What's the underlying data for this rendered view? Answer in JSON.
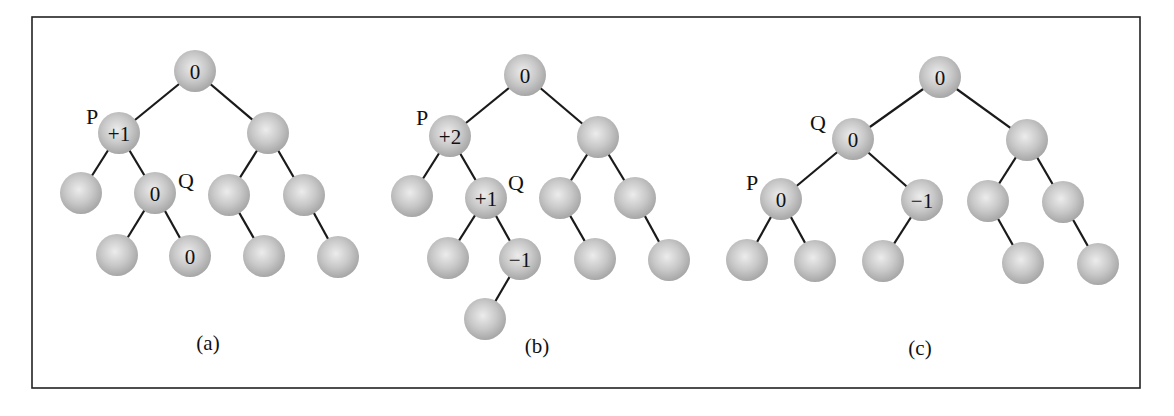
{
  "figure": {
    "frame": {
      "x": 32,
      "y": 17,
      "width": 1108,
      "height": 371
    },
    "node_radius": 21,
    "colors": {
      "node_center": "#ececec",
      "node_mid": "#c8c8c8",
      "node_edge": "#a4a4a4",
      "edge": "#1a1a1a",
      "text": "#111111"
    },
    "trees": [
      {
        "id": "a",
        "caption": "(a)",
        "caption_pos": [
          208,
          343
        ],
        "nodes": [
          {
            "id": "a0",
            "x": 195,
            "y": 71,
            "label": "0"
          },
          {
            "id": "a1",
            "x": 119,
            "y": 133,
            "label": "+1"
          },
          {
            "id": "a2",
            "x": 268,
            "y": 133,
            "label": ""
          },
          {
            "id": "a3",
            "x": 81,
            "y": 193,
            "label": ""
          },
          {
            "id": "a4",
            "x": 155,
            "y": 193,
            "label": "0"
          },
          {
            "id": "a5",
            "x": 229,
            "y": 195,
            "label": ""
          },
          {
            "id": "a6",
            "x": 304,
            "y": 195,
            "label": ""
          },
          {
            "id": "a7",
            "x": 117,
            "y": 255,
            "label": ""
          },
          {
            "id": "a8",
            "x": 190,
            "y": 256,
            "label": "0"
          },
          {
            "id": "a9",
            "x": 264,
            "y": 256,
            "label": ""
          },
          {
            "id": "a10",
            "x": 338,
            "y": 257,
            "label": ""
          }
        ],
        "edges": [
          [
            "a0",
            "a1"
          ],
          [
            "a0",
            "a2"
          ],
          [
            "a1",
            "a3"
          ],
          [
            "a1",
            "a4"
          ],
          [
            "a2",
            "a5"
          ],
          [
            "a2",
            "a6"
          ],
          [
            "a4",
            "a7"
          ],
          [
            "a4",
            "a8"
          ],
          [
            "a5",
            "a9"
          ],
          [
            "a6",
            "a10"
          ]
        ],
        "pointers": [
          {
            "label": "P",
            "x": 92,
            "y": 116
          },
          {
            "label": "Q",
            "x": 186,
            "y": 180
          }
        ]
      },
      {
        "id": "b",
        "caption": "(b)",
        "caption_pos": [
          537,
          346
        ],
        "nodes": [
          {
            "id": "b0",
            "x": 525,
            "y": 75,
            "label": "0"
          },
          {
            "id": "b1",
            "x": 450,
            "y": 136,
            "label": "+2"
          },
          {
            "id": "b2",
            "x": 598,
            "y": 137,
            "label": ""
          },
          {
            "id": "b3",
            "x": 412,
            "y": 196,
            "label": ""
          },
          {
            "id": "b4",
            "x": 486,
            "y": 198,
            "label": "+1"
          },
          {
            "id": "b5",
            "x": 560,
            "y": 198,
            "label": ""
          },
          {
            "id": "b6",
            "x": 635,
            "y": 198,
            "label": ""
          },
          {
            "id": "b7",
            "x": 448,
            "y": 258,
            "label": ""
          },
          {
            "id": "b8",
            "x": 520,
            "y": 259,
            "label": "−1"
          },
          {
            "id": "b9",
            "x": 595,
            "y": 259,
            "label": ""
          },
          {
            "id": "b10",
            "x": 669,
            "y": 260,
            "label": ""
          },
          {
            "id": "b11",
            "x": 485,
            "y": 319,
            "label": ""
          }
        ],
        "edges": [
          [
            "b0",
            "b1"
          ],
          [
            "b0",
            "b2"
          ],
          [
            "b1",
            "b3"
          ],
          [
            "b1",
            "b4"
          ],
          [
            "b2",
            "b5"
          ],
          [
            "b2",
            "b6"
          ],
          [
            "b4",
            "b7"
          ],
          [
            "b4",
            "b8"
          ],
          [
            "b5",
            "b9"
          ],
          [
            "b6",
            "b10"
          ],
          [
            "b8",
            "b11"
          ]
        ],
        "pointers": [
          {
            "label": "P",
            "x": 422,
            "y": 117
          },
          {
            "label": "Q",
            "x": 516,
            "y": 182
          }
        ]
      },
      {
        "id": "c",
        "caption": "(c)",
        "caption_pos": [
          920,
          348
        ],
        "nodes": [
          {
            "id": "c0",
            "x": 940,
            "y": 77,
            "label": "0"
          },
          {
            "id": "c1",
            "x": 853,
            "y": 139,
            "label": "0"
          },
          {
            "id": "c2",
            "x": 1027,
            "y": 140,
            "label": ""
          },
          {
            "id": "c3",
            "x": 781,
            "y": 199,
            "label": "0"
          },
          {
            "id": "c4",
            "x": 922,
            "y": 200,
            "label": "−1"
          },
          {
            "id": "c5",
            "x": 988,
            "y": 201,
            "label": ""
          },
          {
            "id": "c6",
            "x": 1063,
            "y": 202,
            "label": ""
          },
          {
            "id": "c7",
            "x": 747,
            "y": 260,
            "label": ""
          },
          {
            "id": "c8",
            "x": 815,
            "y": 261,
            "label": ""
          },
          {
            "id": "c9",
            "x": 883,
            "y": 261,
            "label": ""
          },
          {
            "id": "c10",
            "x": 1023,
            "y": 263,
            "label": ""
          },
          {
            "id": "c11",
            "x": 1098,
            "y": 264,
            "label": ""
          }
        ],
        "edges": [
          [
            "c0",
            "c1"
          ],
          [
            "c0",
            "c2"
          ],
          [
            "c1",
            "c3"
          ],
          [
            "c1",
            "c4"
          ],
          [
            "c2",
            "c5"
          ],
          [
            "c2",
            "c6"
          ],
          [
            "c3",
            "c7"
          ],
          [
            "c3",
            "c8"
          ],
          [
            "c4",
            "c9"
          ],
          [
            "c5",
            "c10"
          ],
          [
            "c6",
            "c11"
          ]
        ],
        "pointers": [
          {
            "label": "Q",
            "x": 818,
            "y": 122
          },
          {
            "label": "P",
            "x": 752,
            "y": 182
          }
        ]
      }
    ]
  }
}
